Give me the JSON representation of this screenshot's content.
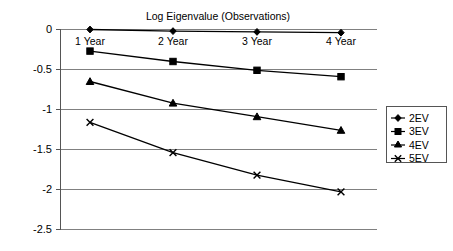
{
  "chart_data": {
    "type": "line",
    "title": "Log Eigenvalue (Observations)",
    "xlabel": "",
    "ylabel": "",
    "categories": [
      "1 Year",
      "2 Year",
      "3 Year",
      "4 Year"
    ],
    "ylim": [
      -2.5,
      0
    ],
    "ytick_labels": [
      "0",
      "-0.5",
      "-1",
      "-1.5",
      "-2",
      "-2.5"
    ],
    "ytick_values": [
      0,
      -0.5,
      -1,
      -1.5,
      -2,
      -2.5
    ],
    "grid": true,
    "legend_position": "right",
    "series": [
      {
        "name": "2EV",
        "marker": "diamond",
        "values": [
          0.0,
          -0.02,
          -0.03,
          -0.04
        ]
      },
      {
        "name": "3EV",
        "marker": "square",
        "values": [
          -0.27,
          -0.4,
          -0.51,
          -0.59
        ]
      },
      {
        "name": "4EV",
        "marker": "triangle",
        "values": [
          -0.65,
          -0.92,
          -1.09,
          -1.26
        ]
      },
      {
        "name": "5EV",
        "marker": "cross",
        "values": [
          -1.16,
          -1.54,
          -1.82,
          -2.03
        ]
      }
    ]
  },
  "labels": {
    "title": "Log Eigenvalue (Observations)",
    "ytick_0": "0",
    "ytick_1": "-0.5",
    "ytick_2": "-1",
    "ytick_3": "-1.5",
    "ytick_4": "-2",
    "ytick_5": "-2.5",
    "cat_0": "1 Year",
    "cat_1": "2 Year",
    "cat_2": "3 Year",
    "cat_3": "4 Year",
    "legend_0": "2EV",
    "legend_1": "3EV",
    "legend_2": "4EV",
    "legend_3": "5EV"
  },
  "colors": {
    "series": "#000000",
    "grid": "#808080",
    "axis": "#555555",
    "background": "#ffffff"
  }
}
